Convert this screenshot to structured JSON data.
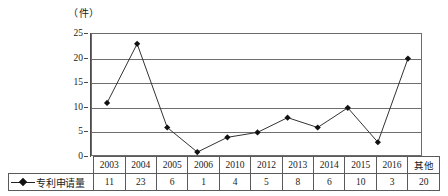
{
  "unit_label": "（件）",
  "legend": {
    "label": "专利申请量",
    "marker": "diamond-marker-icon"
  },
  "axis": {
    "y_ticks": [
      "0",
      "5",
      "10",
      "15",
      "20",
      "25"
    ]
  },
  "chart_data": {
    "type": "line",
    "title": "",
    "subtitle": "",
    "xlabel": "",
    "ylabel": "件",
    "categories": [
      "2003",
      "2004",
      "2005",
      "2006",
      "2010",
      "2012",
      "2013",
      "2014",
      "2015",
      "2016",
      "其他"
    ],
    "values": [
      11,
      23,
      6,
      1,
      4,
      5,
      8,
      6,
      10,
      3,
      20
    ],
    "series": [
      {
        "name": "专利申请量",
        "values": [
          11,
          23,
          6,
          1,
          4,
          5,
          8,
          6,
          10,
          3,
          20
        ]
      }
    ],
    "ylim": [
      0,
      25
    ],
    "ytick_values": [
      0,
      5,
      10,
      15,
      20,
      25
    ],
    "grid": true,
    "legend_position": "table-row-header",
    "marker": "diamond",
    "line_color": "#333333",
    "marker_color": "#111111",
    "grid_color": "#6e6e6e",
    "table_below": true
  },
  "table": {
    "row_header": "专利申请量",
    "columns": [
      "2003",
      "2004",
      "2005",
      "2006",
      "2010",
      "2012",
      "2013",
      "2014",
      "2015",
      "2016",
      "其他"
    ],
    "values": [
      "11",
      "23",
      "6",
      "1",
      "4",
      "5",
      "8",
      "6",
      "10",
      "3",
      "20"
    ]
  }
}
